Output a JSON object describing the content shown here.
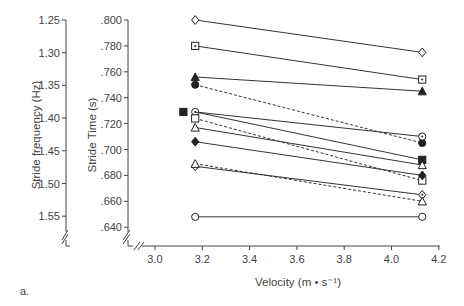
{
  "panel_label": "a.",
  "chart_data": {
    "type": "line",
    "title": "",
    "xlabel": "Velocity (m • s⁻¹)",
    "ylabel": "Stride Time (s)",
    "ylabel_secondary": "Stride frequency (Hz)",
    "xlim": [
      3.0,
      4.2
    ],
    "ylim": [
      0.64,
      0.8
    ],
    "x_ticks": [
      "3.0",
      "3.2",
      "3.4",
      "3.6",
      "3.8",
      "4.0",
      "4.2"
    ],
    "y_ticks": [
      ".800",
      ".780",
      ".760",
      ".740",
      ".720",
      ".700",
      ".680",
      ".660",
      ".640"
    ],
    "y2_ticks": [
      "1.25",
      "1.30",
      "1.35",
      "1.40",
      "1.45",
      "1.50",
      "1.55"
    ],
    "grid": false,
    "legend": "none",
    "x": [
      3.17,
      4.13
    ],
    "series": [
      {
        "name": "open-diamond",
        "marker": "diamond-open",
        "dash": false,
        "values": [
          0.8,
          0.775
        ]
      },
      {
        "name": "dotted-square",
        "marker": "square-dot",
        "dash": false,
        "values": [
          0.78,
          0.754
        ]
      },
      {
        "name": "filled-triangle",
        "marker": "triangle-filled",
        "dash": false,
        "values": [
          0.756,
          0.745
        ]
      },
      {
        "name": "filled-circle",
        "marker": "circle-filled",
        "dash": true,
        "values": [
          0.75,
          0.705
        ]
      },
      {
        "name": "dotted-circle",
        "marker": "circle-dot",
        "dash": false,
        "values": [
          0.729,
          0.71
        ]
      },
      {
        "name": "filled-square",
        "marker": "square-filled",
        "dash": false,
        "x_left": 3.12,
        "values": [
          0.729,
          0.692
        ]
      },
      {
        "name": "open-square",
        "marker": "square-open",
        "dash": true,
        "values": [
          0.724,
          0.676
        ]
      },
      {
        "name": "open-triangle",
        "marker": "triangle-open",
        "dash": false,
        "values": [
          0.717,
          0.688
        ]
      },
      {
        "name": "filled-diamond",
        "marker": "diamond-filled",
        "dash": false,
        "values": [
          0.706,
          0.68
        ]
      },
      {
        "name": "dotted-diamond",
        "marker": "diamond-dot",
        "dash": false,
        "values": [
          0.687,
          0.665
        ]
      },
      {
        "name": "open-triangle-2",
        "marker": "triangle-open",
        "dash": true,
        "values": [
          0.689,
          0.66
        ]
      },
      {
        "name": "open-circle",
        "marker": "circle-open",
        "dash": false,
        "values": [
          0.648,
          0.648
        ]
      }
    ]
  }
}
